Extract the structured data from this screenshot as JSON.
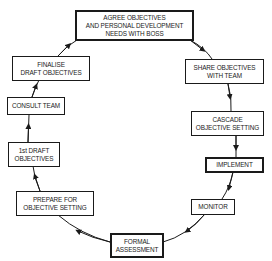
{
  "diagram": {
    "type": "cycle",
    "direction": "clockwise",
    "line_color": "#1a1a1a",
    "steps": [
      {
        "id": "agree",
        "lines": [
          "AGREE OBJECTIVES",
          "AND PERSONAL DEVELOPMENT",
          "NEEDS WITH BOSS"
        ],
        "emphasis": true
      },
      {
        "id": "share",
        "lines": [
          "SHARE OBJECTIVES",
          "WITH TEAM"
        ],
        "emphasis": false
      },
      {
        "id": "cascade",
        "lines": [
          "CASCADE",
          "OBJECTIVE SETTING"
        ],
        "emphasis": false
      },
      {
        "id": "implement",
        "lines": [
          "IMPLEMENT"
        ],
        "emphasis": true
      },
      {
        "id": "monitor",
        "lines": [
          "MONITOR"
        ],
        "emphasis": false
      },
      {
        "id": "formal",
        "lines": [
          "FORMAL",
          "ASSESSMENT"
        ],
        "emphasis": true
      },
      {
        "id": "prepare",
        "lines": [
          "PREPARE FOR",
          "OBJECTIVE SETTING"
        ],
        "emphasis": false
      },
      {
        "id": "first-draft",
        "lines": [
          "1st DRAFT",
          "OBJECTIVES"
        ],
        "emphasis": false
      },
      {
        "id": "consult",
        "lines": [
          "CONSULT TEAM"
        ],
        "emphasis": false
      },
      {
        "id": "finalise",
        "lines": [
          "FINALISE",
          "DRAFT OBJECTIVES"
        ],
        "emphasis": false
      }
    ]
  }
}
